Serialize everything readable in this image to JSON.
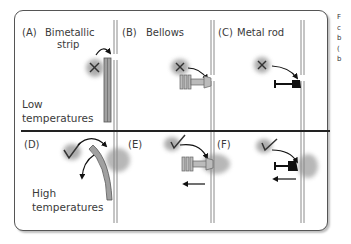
{
  "panels": {
    "A": {
      "tag": "(A)",
      "title": "Bimetallic",
      "title2": "strip"
    },
    "B": {
      "tag": "(B)",
      "title": "Bellows"
    },
    "C": {
      "tag": "(C)",
      "title": "Metal rod"
    },
    "D": {
      "tag": "(D)"
    },
    "E": {
      "tag": "(E)"
    },
    "F": {
      "tag": "(F)"
    }
  },
  "rows": {
    "low": {
      "line1": "Low",
      "line2": "temperatures",
      "state_icon": "x-mark-icon"
    },
    "high": {
      "line1": "High",
      "line2": "temperatures",
      "state_icon": "check-mark-icon"
    }
  },
  "side_text": [
    "F",
    "c",
    "b",
    "(",
    "b"
  ],
  "colors": {
    "frame": "#555555",
    "rail": "#888888",
    "strip": "#999999",
    "divider": "#222222",
    "rod": "#111111"
  }
}
